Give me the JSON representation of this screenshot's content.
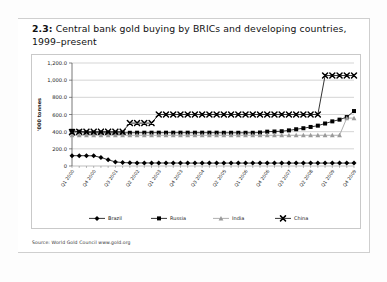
{
  "figure": {
    "number": "2.3:",
    "title": "Central bank gold buying by BRICs and developing countries, 1999–present",
    "source": "Source: World Gold Council www.gold.org"
  },
  "chart_data": {
    "type": "line",
    "title": "Central bank gold buying by BRICs and developing countries, 1999–present",
    "xlabel": "",
    "ylabel": "'000 tonnes",
    "ylim": [
      0,
      1200
    ],
    "yticks": [
      0,
      200,
      400,
      600,
      800,
      1000,
      1200
    ],
    "ytick_labels": [
      "0",
      "200.0",
      "400.0",
      "600.0",
      "800.0",
      "1,000.0",
      "1,200.0"
    ],
    "grid": "horizontal",
    "legend_position": "bottom",
    "x": [
      "Q1 2000",
      "Q2 2000",
      "Q3 2000",
      "Q4 2000",
      "Q1 2001",
      "Q2 2001",
      "Q3 2001",
      "Q4 2001",
      "Q1 2002",
      "Q2 2002",
      "Q3 2002",
      "Q4 2002",
      "Q1 2003",
      "Q2 2003",
      "Q3 2003",
      "Q4 2003",
      "Q1 2004",
      "Q2 2004",
      "Q3 2004",
      "Q4 2004",
      "Q1 2005",
      "Q2 2005",
      "Q3 2005",
      "Q4 2005",
      "Q1 2006",
      "Q2 2006",
      "Q3 2006",
      "Q4 2006",
      "Q1 2007",
      "Q2 2007",
      "Q3 2007",
      "Q4 2007",
      "Q1 2008",
      "Q2 2008",
      "Q3 2008",
      "Q4 2008",
      "Q1 2009",
      "Q2 2009",
      "Q3 2009",
      "Q4 2009"
    ],
    "xtick_labels": [
      "Q1 2000",
      "Q4 2000",
      "Q3 2001",
      "Q2 2002",
      "Q1 2003",
      "Q4 2003",
      "Q3 2004",
      "Q2 2005",
      "Q1 2006",
      "Q4 2006",
      "Q3 2007",
      "Q2 2008",
      "Q1 2009",
      "Q4 2009"
    ],
    "xtick_indices": [
      0,
      3,
      6,
      9,
      12,
      15,
      18,
      21,
      24,
      27,
      30,
      33,
      36,
      39
    ],
    "series": [
      {
        "name": "Brazil",
        "marker": "diamond",
        "color": "#000000",
        "values": [
          120,
          120,
          120,
          118,
          100,
          72,
          48,
          40,
          37,
          36,
          36,
          35,
          35,
          35,
          35,
          34,
          34,
          34,
          34,
          34,
          34,
          34,
          34,
          34,
          34,
          34,
          34,
          34,
          34,
          34,
          34,
          34,
          34,
          34,
          34,
          34,
          34,
          34,
          34,
          34
        ]
      },
      {
        "name": "Russia",
        "marker": "square",
        "color": "#000000",
        "values": [
          410,
          400,
          390,
          388,
          387,
          387,
          387,
          387,
          387,
          388,
          388,
          388,
          388,
          388,
          388,
          388,
          388,
          388,
          388,
          388,
          388,
          387,
          387,
          387,
          387,
          387,
          390,
          400,
          402,
          405,
          415,
          428,
          440,
          455,
          470,
          495,
          520,
          540,
          570,
          640
        ]
      },
      {
        "name": "India",
        "marker": "triangle",
        "color": "#9a9a9a",
        "values": [
          358,
          358,
          358,
          358,
          358,
          358,
          358,
          358,
          358,
          358,
          358,
          358,
          358,
          358,
          358,
          358,
          358,
          358,
          358,
          358,
          358,
          358,
          358,
          358,
          358,
          358,
          358,
          358,
          358,
          358,
          358,
          358,
          358,
          358,
          358,
          358,
          358,
          358,
          558,
          558
        ]
      },
      {
        "name": "China",
        "marker": "cross",
        "color": "#000000",
        "values": [
          395,
          398,
          400,
          400,
          400,
          400,
          400,
          400,
          500,
          500,
          500,
          500,
          600,
          600,
          600,
          600,
          600,
          600,
          600,
          600,
          600,
          600,
          600,
          600,
          600,
          600,
          600,
          600,
          600,
          600,
          600,
          600,
          600,
          600,
          600,
          1054,
          1054,
          1054,
          1054,
          1054
        ]
      }
    ]
  }
}
